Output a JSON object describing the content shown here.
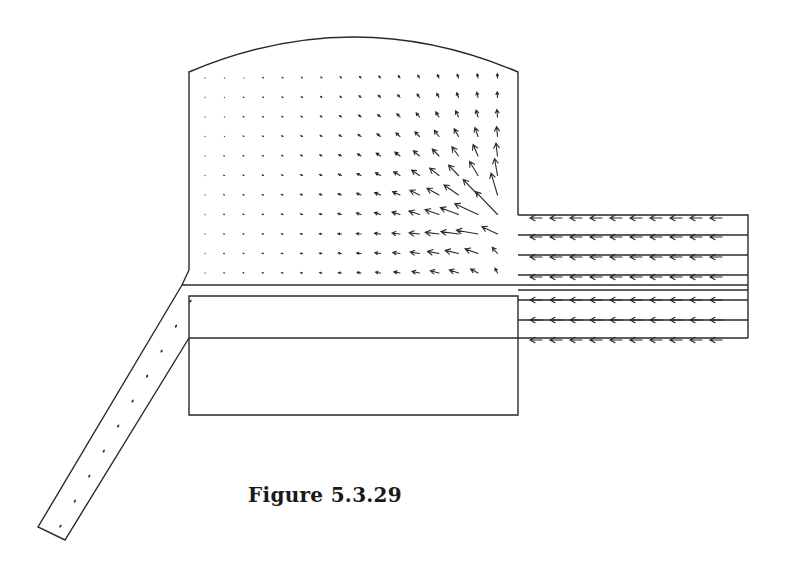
{
  "figure": {
    "caption": "Figure 5.3.29",
    "stroke_color": "#2a2a2a"
  },
  "geometry": {
    "chamber": {
      "left": 189,
      "right": 518,
      "top": 72,
      "arc_peak_y": 37,
      "bottom": 285
    },
    "inlet_channel": {
      "left": 518,
      "right": 748,
      "top": 215,
      "bottom": 338,
      "lines_y": [
        235,
        255,
        275,
        285,
        290,
        300,
        320
      ]
    },
    "inner_box": {
      "left": 189,
      "right": 518,
      "top": 296,
      "bottom": 415,
      "divider_y": 338
    },
    "outlet_pipe": {
      "top_outer": [
        182,
        285
      ],
      "top_inner": [
        189,
        338
      ],
      "bottom_outer": [
        38,
        527
      ],
      "bottom_inner": [
        65,
        540
      ]
    }
  },
  "vector_field": {
    "grid_x0": 205,
    "grid_dx": 19.5,
    "cols": 16,
    "grid_y0": 78,
    "grid_dy": 19.5,
    "rows": 11,
    "inlet_rows_y": [
      218,
      237,
      257,
      277,
      300,
      320,
      340
    ],
    "inlet_arrow_x": [
      530,
      550,
      570,
      590,
      610,
      630,
      650,
      670,
      690,
      710
    ]
  }
}
